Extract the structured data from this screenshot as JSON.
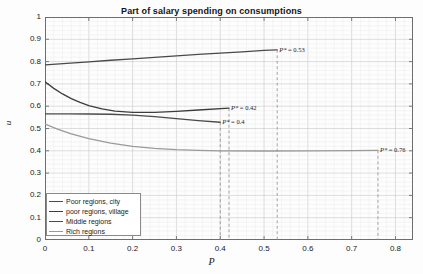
{
  "chart_data": {
    "type": "line",
    "title": "Part of salary spending on consumptions",
    "xlabel": "P",
    "ylabel": "u",
    "xlim": [
      0,
      0.84
    ],
    "ylim": [
      0,
      1
    ],
    "xticks": [
      "0",
      "0.1",
      "0.2",
      "0.3",
      "0.4",
      "0.5",
      "0.6",
      "0.7",
      "0.8"
    ],
    "xtick_values": [
      0,
      0.1,
      0.2,
      0.3,
      0.4,
      0.5,
      0.6,
      0.7,
      0.8
    ],
    "yticks": [
      "0",
      "0.1",
      "0.2",
      "0.3",
      "0.4",
      "0.5",
      "0.6",
      "0.7",
      "0.8",
      "0.9",
      "1"
    ],
    "ytick_values": [
      0,
      0.1,
      0.2,
      0.3,
      0.4,
      0.5,
      0.6,
      0.7,
      0.8,
      0.9,
      1
    ],
    "grid": true,
    "legend_position": "lower-left",
    "series": [
      {
        "name": "Poor regions, city",
        "color": "#4a4a4a",
        "x": [
          0,
          0.05,
          0.1,
          0.15,
          0.2,
          0.25,
          0.3,
          0.35,
          0.4,
          0.45,
          0.5,
          0.53
        ],
        "y": [
          0.785,
          0.792,
          0.799,
          0.806,
          0.812,
          0.819,
          0.826,
          0.832,
          0.838,
          0.844,
          0.85,
          0.853
        ],
        "endpoint": {
          "x": 0.53,
          "y": 0.853
        }
      },
      {
        "name": "poor regions, village",
        "color": "#3d3d3d",
        "x": [
          0,
          0.02,
          0.04,
          0.06,
          0.08,
          0.1,
          0.13,
          0.16,
          0.2,
          0.25,
          0.3,
          0.35,
          0.42
        ],
        "y": [
          0.71,
          0.68,
          0.655,
          0.634,
          0.617,
          0.603,
          0.588,
          0.578,
          0.572,
          0.572,
          0.577,
          0.583,
          0.591
        ],
        "endpoint": {
          "x": 0.42,
          "y": 0.591
        }
      },
      {
        "name": "Middle regions",
        "color": "#4a4a4a",
        "x": [
          0,
          0.05,
          0.1,
          0.15,
          0.2,
          0.25,
          0.3,
          0.35,
          0.4
        ],
        "y": [
          0.566,
          0.566,
          0.565,
          0.564,
          0.56,
          0.553,
          0.544,
          0.535,
          0.528
        ],
        "endpoint": {
          "x": 0.4,
          "y": 0.528
        }
      },
      {
        "name": "Rich regions",
        "color": "#9a9a9a",
        "x": [
          0,
          0.03,
          0.06,
          0.1,
          0.15,
          0.2,
          0.25,
          0.3,
          0.35,
          0.4,
          0.5,
          0.6,
          0.7,
          0.76
        ],
        "y": [
          0.52,
          0.496,
          0.476,
          0.455,
          0.434,
          0.42,
          0.411,
          0.405,
          0.402,
          0.4,
          0.399,
          0.4,
          0.401,
          0.402
        ],
        "endpoint": {
          "x": 0.76,
          "y": 0.402
        }
      }
    ],
    "annotations": [
      {
        "id": "p-star-city",
        "symbol": "P*",
        "text": "P* = 0.53",
        "value": 0.53,
        "x": 0.53,
        "y": 0.853,
        "dashed_to_zero": true
      },
      {
        "id": "p-star-village",
        "symbol": "P*",
        "text": "P* = 0.42",
        "value": 0.42,
        "x": 0.42,
        "y": 0.591,
        "dashed_to_zero": true
      },
      {
        "id": "p-star-middle",
        "symbol": "P*",
        "text": "P* = 0.4",
        "value": 0.4,
        "x": 0.4,
        "y": 0.528,
        "dashed_to_zero": true
      },
      {
        "id": "p-star-rich",
        "symbol": "P*",
        "text": "P* = 0.76",
        "value": 0.76,
        "x": 0.76,
        "y": 0.402,
        "dashed_to_zero": true
      }
    ]
  },
  "legend": {
    "items": [
      {
        "label": "Poor regions, city"
      },
      {
        "label": "poor regions, village"
      },
      {
        "label": "Middle regions"
      },
      {
        "label": "Rich regions"
      }
    ]
  }
}
